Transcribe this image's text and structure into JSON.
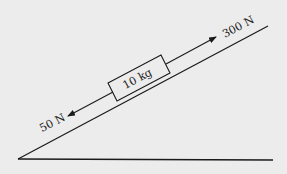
{
  "diagram": {
    "type": "inclined-plane-free-body",
    "background": "#ececec",
    "stroke": "#1a1a1a",
    "block": {
      "label": "10 kg",
      "mass": "10 kg"
    },
    "forces": [
      {
        "label": "300 N",
        "direction": "up-slope"
      },
      {
        "label": "50 N",
        "direction": "down-slope"
      }
    ],
    "incline": {
      "start": [
        18,
        159
      ],
      "end": [
        268,
        26
      ]
    },
    "base": {
      "start": [
        18,
        159
      ],
      "end": [
        273,
        160
      ]
    }
  }
}
